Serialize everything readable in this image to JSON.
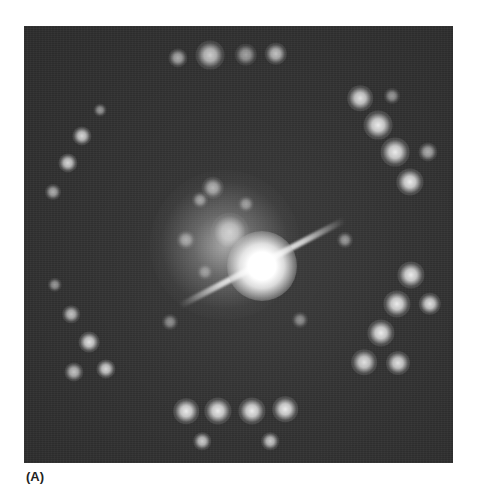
{
  "figure": {
    "panel_label": "(A)",
    "colors": {
      "background": "#ffffff",
      "pattern_background": "#333333",
      "spot": "#ffffff",
      "label": "#222222"
    },
    "frame": {
      "x": 24,
      "y": 26,
      "width": 429,
      "height": 437
    },
    "center_beam": {
      "x": 262,
      "y": 266,
      "size": 70
    },
    "halo": {
      "x": 225,
      "y": 245,
      "size": 150
    },
    "streak": {
      "x1": 180,
      "y1": 306,
      "x2": 345,
      "y2": 220,
      "thickness": 6
    },
    "spots": [
      {
        "x": 178,
        "y": 58,
        "size": 12,
        "intensity": 0.6
      },
      {
        "x": 210,
        "y": 55,
        "size": 18,
        "intensity": 0.75
      },
      {
        "x": 246,
        "y": 55,
        "size": 14,
        "intensity": 0.55
      },
      {
        "x": 276,
        "y": 54,
        "size": 14,
        "intensity": 0.7
      },
      {
        "x": 360,
        "y": 98,
        "size": 16,
        "intensity": 0.85
      },
      {
        "x": 392,
        "y": 96,
        "size": 10,
        "intensity": 0.5
      },
      {
        "x": 378,
        "y": 125,
        "size": 18,
        "intensity": 0.9
      },
      {
        "x": 395,
        "y": 152,
        "size": 18,
        "intensity": 0.9
      },
      {
        "x": 428,
        "y": 152,
        "size": 12,
        "intensity": 0.6
      },
      {
        "x": 410,
        "y": 182,
        "size": 17,
        "intensity": 0.9
      },
      {
        "x": 100,
        "y": 110,
        "size": 8,
        "intensity": 0.5
      },
      {
        "x": 82,
        "y": 136,
        "size": 12,
        "intensity": 0.8
      },
      {
        "x": 68,
        "y": 163,
        "size": 12,
        "intensity": 0.8
      },
      {
        "x": 53,
        "y": 192,
        "size": 10,
        "intensity": 0.6
      },
      {
        "x": 411,
        "y": 275,
        "size": 17,
        "intensity": 0.9
      },
      {
        "x": 397,
        "y": 304,
        "size": 17,
        "intensity": 0.9
      },
      {
        "x": 430,
        "y": 304,
        "size": 14,
        "intensity": 0.85
      },
      {
        "x": 381,
        "y": 333,
        "size": 17,
        "intensity": 0.9
      },
      {
        "x": 364,
        "y": 362,
        "size": 16,
        "intensity": 0.85
      },
      {
        "x": 398,
        "y": 363,
        "size": 15,
        "intensity": 0.85
      },
      {
        "x": 55,
        "y": 285,
        "size": 9,
        "intensity": 0.5
      },
      {
        "x": 71,
        "y": 314,
        "size": 11,
        "intensity": 0.7
      },
      {
        "x": 89,
        "y": 342,
        "size": 13,
        "intensity": 0.85
      },
      {
        "x": 74,
        "y": 372,
        "size": 12,
        "intensity": 0.7
      },
      {
        "x": 106,
        "y": 369,
        "size": 12,
        "intensity": 0.8
      },
      {
        "x": 186,
        "y": 411,
        "size": 16,
        "intensity": 0.9
      },
      {
        "x": 218,
        "y": 411,
        "size": 17,
        "intensity": 0.9
      },
      {
        "x": 252,
        "y": 411,
        "size": 17,
        "intensity": 0.9
      },
      {
        "x": 285,
        "y": 409,
        "size": 16,
        "intensity": 0.9
      },
      {
        "x": 202,
        "y": 441,
        "size": 11,
        "intensity": 0.75
      },
      {
        "x": 270,
        "y": 441,
        "size": 11,
        "intensity": 0.75
      },
      {
        "x": 213,
        "y": 188,
        "size": 14,
        "intensity": 0.6
      },
      {
        "x": 200,
        "y": 200,
        "size": 10,
        "intensity": 0.5
      },
      {
        "x": 186,
        "y": 240,
        "size": 12,
        "intensity": 0.5
      },
      {
        "x": 230,
        "y": 232,
        "size": 24,
        "intensity": 0.6
      },
      {
        "x": 246,
        "y": 204,
        "size": 10,
        "intensity": 0.45
      },
      {
        "x": 300,
        "y": 320,
        "size": 10,
        "intensity": 0.45
      },
      {
        "x": 345,
        "y": 240,
        "size": 10,
        "intensity": 0.5
      },
      {
        "x": 170,
        "y": 322,
        "size": 10,
        "intensity": 0.45
      },
      {
        "x": 205,
        "y": 272,
        "size": 10,
        "intensity": 0.4
      }
    ]
  }
}
